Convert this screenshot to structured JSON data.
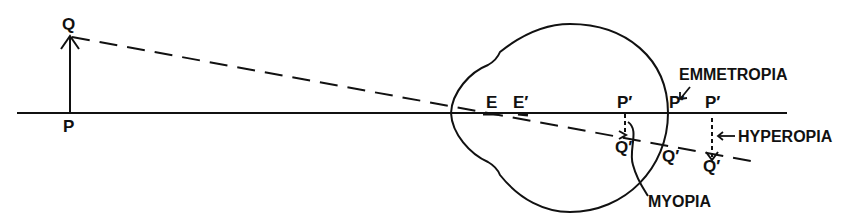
{
  "diagram": {
    "type": "optics-eye-refraction",
    "colors": {
      "ink": "#111111",
      "background": "#ffffff"
    },
    "labels": {
      "object_top": "Q",
      "object_base": "P",
      "nodal_point_1": "E",
      "nodal_point_2": "E′",
      "image_myopia_p": "P′",
      "image_myopia_q": "Q′",
      "image_emmetropia_p": "P′",
      "image_emmetropia_q": "Q′",
      "image_hyperopia_p": "P′",
      "image_hyperopia_q": "Q′",
      "emmetropia": "EMMETROPIA",
      "hyperopia": "HYPEROPIA",
      "myopia": "MYOPIA"
    }
  }
}
